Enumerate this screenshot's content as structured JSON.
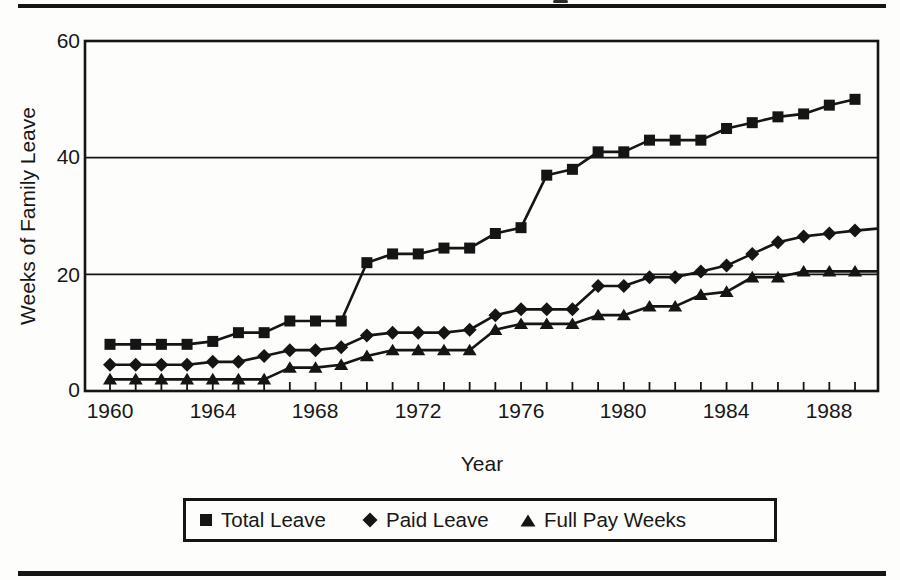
{
  "figure": {
    "top_rule": true,
    "bottom_rule": true,
    "cropped_title_fragment": "partial glyph descender visible above top rule"
  },
  "chart_data": {
    "type": "line",
    "title": "",
    "xlabel": "Year",
    "ylabel": "Weeks of Family Leave",
    "xlim": [
      1959,
      1990
    ],
    "ylim": [
      0,
      60
    ],
    "grid": "horizontal",
    "gridlines_y": [
      20,
      40
    ],
    "y_ticks": [
      0,
      20,
      40,
      60
    ],
    "y_tick_labels": [
      "60",
      "40",
      "20",
      "0"
    ],
    "x_tick_labels": [
      "1960",
      "1964",
      "1968",
      "1972",
      "1976",
      "1980",
      "1984",
      "1988"
    ],
    "legend_position": "bottom",
    "ink_color": "#151515",
    "background_color": "#fdfdfb",
    "x": [
      1960,
      1961,
      1962,
      1963,
      1964,
      1965,
      1966,
      1967,
      1968,
      1969,
      1970,
      1971,
      1972,
      1973,
      1974,
      1975,
      1976,
      1977,
      1978,
      1979,
      1980,
      1981,
      1982,
      1983,
      1984,
      1985,
      1986,
      1987,
      1988,
      1989
    ],
    "series": [
      {
        "name": "Total Leave",
        "marker": "square",
        "color": "#151515",
        "extend_right": false,
        "values": [
          8,
          8,
          8,
          8,
          8.5,
          10,
          10,
          12,
          12,
          12,
          22,
          23.5,
          23.5,
          24.5,
          24.5,
          27,
          28,
          37,
          38,
          41,
          41,
          43,
          43,
          43,
          45,
          46,
          47,
          47.5,
          49,
          50
        ]
      },
      {
        "name": "Paid Leave",
        "marker": "diamond",
        "color": "#151515",
        "extend_right": true,
        "values": [
          4.5,
          4.5,
          4.5,
          4.5,
          5,
          5,
          6,
          7,
          7,
          7.5,
          9.5,
          10,
          10,
          10,
          10.5,
          13,
          14,
          14,
          14,
          18,
          18,
          19.5,
          19.5,
          20.5,
          21.5,
          23.5,
          25.5,
          26.5,
          27,
          27.5
        ]
      },
      {
        "name": "Full Pay Weeks",
        "marker": "triangle",
        "color": "#151515",
        "extend_right": true,
        "values": [
          2,
          2,
          2,
          2,
          2,
          2,
          2,
          4,
          4,
          4.5,
          6,
          7,
          7,
          7,
          7,
          10.5,
          11.5,
          11.5,
          11.5,
          13,
          13,
          14.5,
          14.5,
          16.5,
          17,
          19.5,
          19.5,
          20.5,
          20.5,
          20.5
        ]
      }
    ]
  }
}
